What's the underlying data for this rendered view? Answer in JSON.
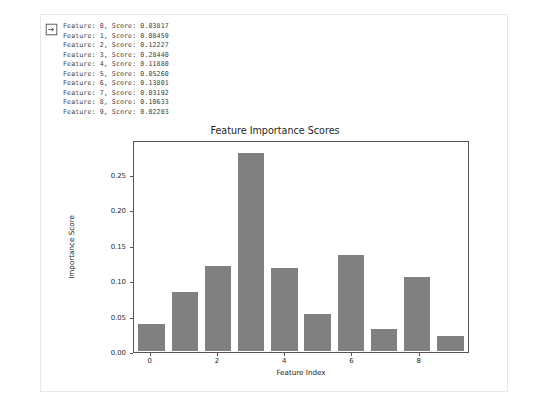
{
  "cell": {
    "icon": "output-arrow-icon"
  },
  "stdout": {
    "lines": [
      "Feature: 0, Score: 0.03817",
      "Feature: 1, Score: 0.08459",
      "Feature: 2, Score: 0.12227",
      "Feature: 3, Score: 0.28440",
      "Feature: 4, Score: 0.11880",
      "Feature: 5, Score: 0.05260",
      "Feature: 6, Score: 0.13801",
      "Feature: 7, Score: 0.03192",
      "Feature: 8, Score: 0.10633",
      "Feature: 9, Score: 0.02203"
    ]
  },
  "chart_data": {
    "type": "bar",
    "title": "Feature Importance Scores",
    "xlabel": "Feature Index",
    "ylabel": "Importance Score",
    "categories": [
      0,
      1,
      2,
      3,
      4,
      5,
      6,
      7,
      8,
      9
    ],
    "values": [
      0.03817,
      0.08459,
      0.12227,
      0.2844,
      0.1188,
      0.0526,
      0.13801,
      0.03192,
      0.10633,
      0.02203
    ],
    "bar_color": "#808080",
    "xlim": [
      -0.5,
      9.5
    ],
    "ylim": [
      0.0,
      0.2986
    ],
    "yticks": [
      0.0,
      0.05,
      0.1,
      0.15,
      0.2,
      0.25
    ],
    "ytick_labels": [
      "0.00",
      "0.05",
      "0.10",
      "0.15",
      "0.20",
      "0.25"
    ],
    "xticks": [
      0,
      2,
      4,
      6,
      8
    ],
    "xtick_labels": [
      "0",
      "2",
      "4",
      "6",
      "8"
    ],
    "grid": false,
    "legend": null
  }
}
